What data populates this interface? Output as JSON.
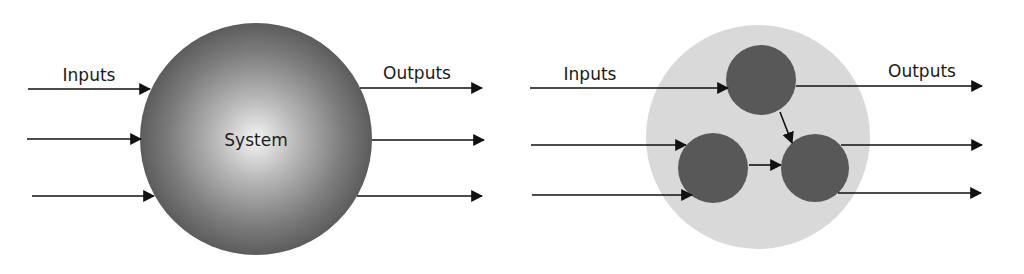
{
  "diagram_left": {
    "title": "Monolithic system",
    "inputs_label": "Inputs",
    "outputs_label": "Outputs",
    "system_label": "System",
    "input_count": 3,
    "output_count": 3,
    "colors": {
      "sphere_center": "#f2f2f2",
      "sphere_edge": "#5a5a5a",
      "arrow": "#111111"
    }
  },
  "diagram_right": {
    "title": "Decomposed system",
    "inputs_label": "Inputs",
    "outputs_label": "Outputs",
    "subsystems": [
      {
        "id": "top",
        "cx": 761,
        "cy": 80
      },
      {
        "id": "bottom-left",
        "cx": 713,
        "cy": 168
      },
      {
        "id": "bottom-right",
        "cx": 815,
        "cy": 168
      }
    ],
    "internal_links": [
      {
        "from": "top",
        "to": "bottom-right"
      },
      {
        "from": "bottom-left",
        "to": "bottom-right"
      }
    ],
    "input_count": 3,
    "output_count": 3,
    "colors": {
      "container": "#d9d9d9",
      "subsystem": "#585858",
      "arrow": "#111111"
    }
  }
}
